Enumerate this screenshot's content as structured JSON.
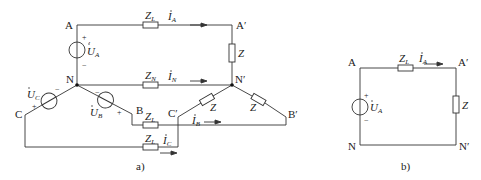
{
  "figure_a": {
    "caption": "a)",
    "nodes": {
      "A": "A",
      "A_prime": "A′",
      "N": "N",
      "N_prime": "N′",
      "B": "B",
      "B_prime": "B′",
      "C": "C",
      "C_prime": "C′"
    },
    "sources": [
      {
        "name": "U",
        "sub": "A",
        "plus": "+",
        "minus": "−"
      },
      {
        "name": "U",
        "sub": "B",
        "plus": "+",
        "minus": "−"
      },
      {
        "name": "U",
        "sub": "C",
        "plus": "+",
        "minus": "−"
      }
    ],
    "impedances": {
      "ZL": "Z",
      "ZL_sub": "L",
      "ZN": "Z",
      "ZN_sub": "N",
      "Z": "Z"
    },
    "currents": [
      {
        "name": "I",
        "sub": "A"
      },
      {
        "name": "I",
        "sub": "N"
      },
      {
        "name": "I",
        "sub": "B"
      },
      {
        "name": "I",
        "sub": "C"
      }
    ]
  },
  "figure_b": {
    "caption": "b)",
    "nodes": {
      "A": "A",
      "A_prime": "A′",
      "N": "N",
      "N_prime": "N′"
    },
    "source": {
      "name": "U",
      "sub": "A",
      "plus": "+",
      "minus": "−"
    },
    "impedances": {
      "ZL": "Z",
      "ZL_sub": "L",
      "Z": "Z"
    },
    "current": {
      "name": "I",
      "sub": "A"
    }
  }
}
